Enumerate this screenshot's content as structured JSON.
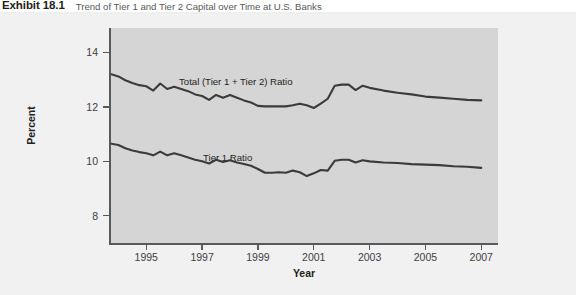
{
  "exhibit": {
    "number": "Exhibit 18.1",
    "title": "Trend of Tier 1 and Tier 2 Capital over Time at U.S. Banks"
  },
  "colors": {
    "panel": "#d5d5d5",
    "figure_bg": "#f1f1f1",
    "line": "#3b3b3b",
    "axis": "#58595b",
    "text": "#231f20"
  },
  "chart_data": {
    "type": "line",
    "title": "Trend of Tier 1 and Tier 2 Capital over Time at U.S. Banks",
    "xlabel": "Year",
    "ylabel": "Percent",
    "xlim": [
      1993.7,
      2007.6
    ],
    "ylim": [
      7.0,
      14.9
    ],
    "xticks": [
      1995,
      1997,
      1999,
      2001,
      2003,
      2005,
      2007
    ],
    "xtick_labels": [
      "1995",
      "1997",
      "1999",
      "2001",
      "2003",
      "2005",
      "2007"
    ],
    "yticks": [
      8,
      10,
      12,
      14
    ],
    "ytick_labels": [
      "8",
      "10",
      "12",
      "14"
    ],
    "grid": false,
    "legend_position": "inline-annotation",
    "annotations": [
      {
        "text": "Total (Tier 1 + Tier 2) Ratio",
        "x": 1996.6,
        "y": 13.3
      },
      {
        "text": "Tier 1 Ratio",
        "x": 1997.5,
        "y": 10.5
      }
    ],
    "x": [
      1993.75,
      1994.0,
      1994.25,
      1994.5,
      1994.75,
      1995.0,
      1995.25,
      1995.5,
      1995.75,
      1996.0,
      1996.25,
      1996.5,
      1996.75,
      1997.0,
      1997.25,
      1997.5,
      1997.75,
      1998.0,
      1998.25,
      1998.5,
      1998.75,
      1999.0,
      1999.25,
      1999.5,
      1999.75,
      2000.0,
      2000.25,
      2000.5,
      2000.75,
      2001.0,
      2001.25,
      2001.5,
      2001.75,
      2002.0,
      2002.25,
      2002.5,
      2002.75,
      2003.0,
      2003.5,
      2004.0,
      2004.5,
      2005.0,
      2005.5,
      2006.0,
      2006.5,
      2007.0
    ],
    "series": [
      {
        "name": "Total (Tier 1 + Tier 2) Ratio",
        "values": [
          13.2,
          13.12,
          12.98,
          12.88,
          12.8,
          12.76,
          12.6,
          12.86,
          12.66,
          12.74,
          12.66,
          12.58,
          12.46,
          12.4,
          12.26,
          12.44,
          12.34,
          12.44,
          12.34,
          12.24,
          12.16,
          12.04,
          12.02,
          12.02,
          12.02,
          12.02,
          12.06,
          12.12,
          12.06,
          11.96,
          12.12,
          12.3,
          12.78,
          12.82,
          12.82,
          12.62,
          12.78,
          12.7,
          12.6,
          12.52,
          12.46,
          12.38,
          12.34,
          12.3,
          12.26,
          12.24
        ]
      },
      {
        "name": "Tier 1 Ratio",
        "values": [
          10.65,
          10.6,
          10.48,
          10.4,
          10.34,
          10.3,
          10.22,
          10.36,
          10.22,
          10.3,
          10.22,
          10.14,
          10.06,
          10.0,
          9.92,
          10.06,
          9.98,
          10.04,
          9.96,
          9.9,
          9.84,
          9.72,
          9.58,
          9.58,
          9.6,
          9.58,
          9.66,
          9.6,
          9.46,
          9.56,
          9.68,
          9.66,
          10.02,
          10.06,
          10.06,
          9.96,
          10.04,
          10.0,
          9.96,
          9.94,
          9.9,
          9.88,
          9.86,
          9.82,
          9.8,
          9.76
        ]
      }
    ]
  }
}
